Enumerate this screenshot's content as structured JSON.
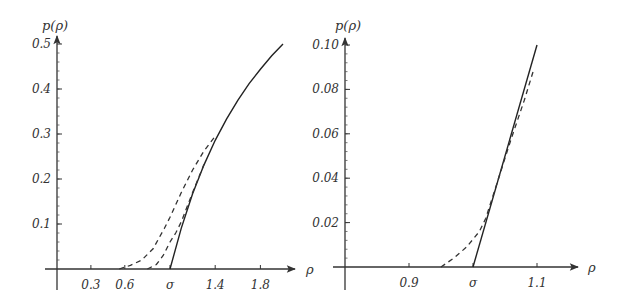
{
  "chart_data": [
    {
      "type": "line",
      "panel": "left",
      "title": "",
      "xlabel": "ρ",
      "ylabel": "p(ρ)",
      "xlim": [
        0.0,
        2.1
      ],
      "ylim": [
        0.0,
        0.5
      ],
      "x_ticks": [
        {
          "value": 0.3,
          "label": "0.3"
        },
        {
          "value": 0.6,
          "label": "0.6"
        },
        {
          "value": 1.0,
          "label": "σ"
        },
        {
          "value": 1.4,
          "label": "1.4"
        },
        {
          "value": 1.8,
          "label": "1.8"
        }
      ],
      "y_ticks": [
        {
          "value": 0.1,
          "label": "0.1"
        },
        {
          "value": 0.2,
          "label": "0.2"
        },
        {
          "value": 0.3,
          "label": "0.3"
        },
        {
          "value": 0.4,
          "label": "0.4"
        },
        {
          "value": 0.5,
          "label": "0.5"
        }
      ],
      "grid": false,
      "legend": null,
      "series": [
        {
          "name": "exact (solid)",
          "style": "solid",
          "x": [
            1.0,
            1.1,
            1.2,
            1.3,
            1.4,
            1.5,
            1.6,
            1.7,
            1.8,
            1.9,
            2.0
          ],
          "y": [
            0.0,
            0.091,
            0.167,
            0.231,
            0.286,
            0.333,
            0.375,
            0.412,
            0.444,
            0.474,
            0.5
          ]
        },
        {
          "name": "approximation 1 (dashed, wide)",
          "style": "dashed",
          "x": [
            0.55,
            0.65,
            0.75,
            0.85,
            0.95,
            1.0,
            1.1,
            1.2,
            1.3,
            1.4
          ],
          "y": [
            0.0,
            0.008,
            0.02,
            0.045,
            0.09,
            0.115,
            0.17,
            0.22,
            0.262,
            0.295
          ]
        },
        {
          "name": "approximation 2 (dashed, narrow)",
          "style": "dashed",
          "x": [
            0.8,
            0.88,
            0.94,
            1.0,
            1.05,
            1.1,
            1.2,
            1.3
          ],
          "y": [
            0.0,
            0.01,
            0.03,
            0.06,
            0.08,
            0.105,
            0.17,
            0.232
          ]
        }
      ]
    },
    {
      "type": "line",
      "panel": "right",
      "title": "",
      "xlabel": "ρ",
      "ylabel": "p(ρ)",
      "xlim": [
        0.8,
        1.15
      ],
      "ylim": [
        0.0,
        0.1
      ],
      "x_ticks": [
        {
          "value": 0.9,
          "label": "0.9"
        },
        {
          "value": 1.0,
          "label": "σ"
        },
        {
          "value": 1.1,
          "label": "1.1"
        }
      ],
      "y_ticks": [
        {
          "value": 0.02,
          "label": "0.02"
        },
        {
          "value": 0.04,
          "label": "0.04"
        },
        {
          "value": 0.06,
          "label": "0.06"
        },
        {
          "value": 0.08,
          "label": "0.08"
        },
        {
          "value": 0.1,
          "label": "0.10"
        }
      ],
      "grid": false,
      "legend": null,
      "series": [
        {
          "name": "exact (solid)",
          "style": "solid",
          "x": [
            1.0,
            1.1
          ],
          "y": [
            0.0,
            0.1
          ]
        },
        {
          "name": "approximation (dashed)",
          "style": "dashed",
          "x": [
            0.95,
            0.97,
            0.99,
            1.01,
            1.02,
            1.04,
            1.06,
            1.08,
            1.095
          ],
          "y": [
            0.0,
            0.004,
            0.009,
            0.016,
            0.022,
            0.04,
            0.058,
            0.075,
            0.089
          ]
        }
      ]
    }
  ]
}
